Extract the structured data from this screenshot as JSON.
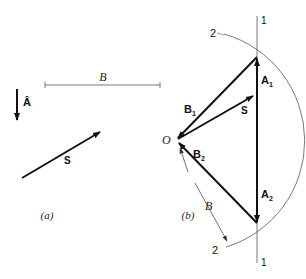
{
  "figure": {
    "panel_a": {
      "caption": "(a)",
      "length_label": "B",
      "unit_vector_label": "Â",
      "vector_label": "S"
    },
    "panel_b": {
      "caption": "(b)",
      "origin_label": "O",
      "vectors": {
        "b1": "B",
        "b1_sub": "1",
        "b2": "B",
        "b2_sub": "2",
        "a1": "A",
        "a1_sub": "1",
        "a2": "A",
        "a2_sub": "2",
        "s": "S"
      },
      "length_label": "B",
      "line_labels": {
        "line1_top": "1",
        "line1_bottom": "1",
        "arc2_top": "2",
        "arc2_bottom": "2"
      }
    },
    "colors": {
      "ink": "#111111",
      "thin": "#555555",
      "background": "#ffffff"
    }
  }
}
